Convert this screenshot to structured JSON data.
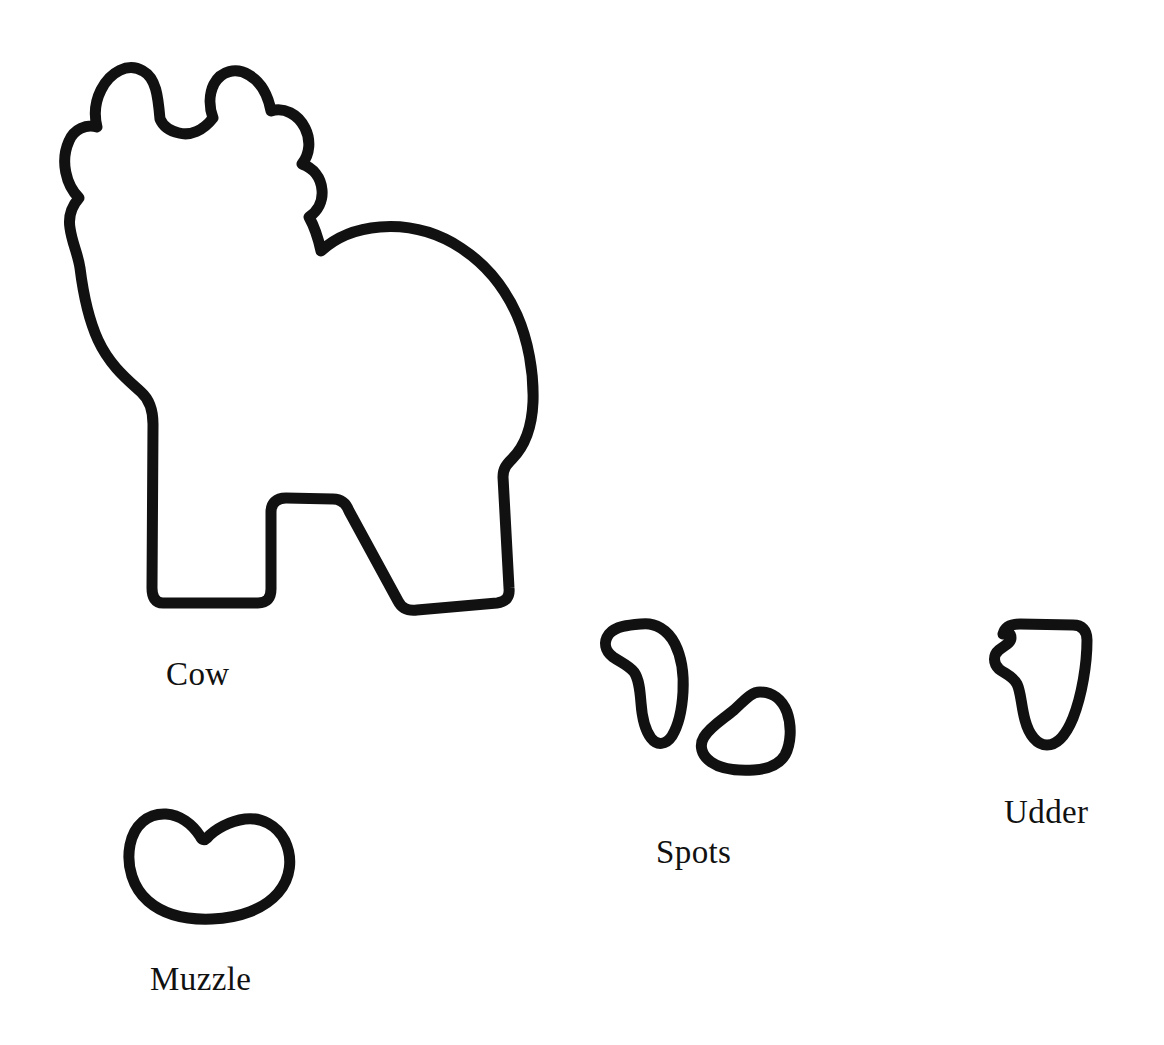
{
  "page": {
    "background_color": "#ffffff",
    "ink_color": "#111111",
    "width": 1164,
    "height": 1045
  },
  "pattern": {
    "description": "Hand-drawn black outline cut-out pattern pieces for a paper cow craft",
    "stroke_color": "#111111",
    "fill_color": "#ffffff",
    "pieces": [
      {
        "id": "cow",
        "label": "Cow",
        "icon": "cow-body-outline-icon",
        "label_x": 166,
        "label_y": 658
      },
      {
        "id": "spots",
        "label": "Spots",
        "icon": "spot-outline-icon",
        "count": 2,
        "label_x": 656,
        "label_y": 836
      },
      {
        "id": "udder",
        "label": "Udder",
        "icon": "udder-outline-icon",
        "label_x": 1004,
        "label_y": 796
      },
      {
        "id": "muzzle",
        "label": "Muzzle",
        "icon": "muzzle-outline-icon",
        "label_x": 150,
        "label_y": 963
      }
    ]
  },
  "labels": {
    "cow": "Cow",
    "spots": "Spots",
    "udder": "Udder",
    "muzzle": "Muzzle"
  }
}
